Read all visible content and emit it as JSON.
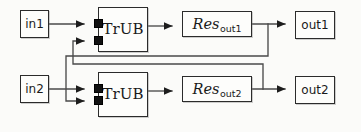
{
  "diagram": {
    "type": "block-diagram",
    "background_color": "#fbfbf9",
    "line_color": "#4a4a4a",
    "box_border_color": "#2b2b2b",
    "box_fill_color": "#fdfdfb",
    "port_color": "#111111",
    "nodes": [
      {
        "id": "in1",
        "label": "in1",
        "kind": "input",
        "x": 20,
        "y": 10,
        "w": 29,
        "h": 28
      },
      {
        "id": "in2",
        "label": "in2",
        "kind": "input",
        "x": 20,
        "y": 75,
        "w": 29,
        "h": 28
      },
      {
        "id": "trub1",
        "label": "TrUB",
        "kind": "process",
        "x": 98,
        "y": 7,
        "w": 50,
        "h": 45
      },
      {
        "id": "trub2",
        "label": "TrUB",
        "kind": "process",
        "x": 98,
        "y": 72,
        "w": 50,
        "h": 45
      },
      {
        "id": "res1",
        "label_main": "Res",
        "label_sub": "out1",
        "kind": "resource",
        "x": 182,
        "y": 11,
        "w": 70,
        "h": 26
      },
      {
        "id": "res2",
        "label_main": "Res",
        "label_sub": "out2",
        "kind": "resource",
        "x": 182,
        "y": 76,
        "w": 70,
        "h": 26
      },
      {
        "id": "out1",
        "label": "out1",
        "kind": "output",
        "x": 295,
        "y": 11,
        "w": 40,
        "h": 28
      },
      {
        "id": "out2",
        "label": "out2",
        "kind": "output",
        "x": 295,
        "y": 76,
        "w": 40,
        "h": 28
      }
    ],
    "ports": [
      {
        "id": "trub1-port-top",
        "node": "trub1",
        "x": 94,
        "y": 17
      },
      {
        "id": "trub1-port-bottom",
        "node": "trub1",
        "x": 94,
        "y": 34
      },
      {
        "id": "trub2-port-top",
        "node": "trub2",
        "x": 94,
        "y": 82
      },
      {
        "id": "trub2-port-bottom",
        "node": "trub2",
        "x": 94,
        "y": 99
      }
    ],
    "edges": [
      {
        "id": "e-in1-trub1",
        "from": "in1",
        "to": "trub1-port-top",
        "arrow": true
      },
      {
        "id": "e-in2-trub2",
        "from": "in2",
        "to": "trub2-port-top",
        "arrow": true
      },
      {
        "id": "e-trub1-res1",
        "from": "trub1",
        "to": "res1",
        "arrow": true
      },
      {
        "id": "e-trub2-res2",
        "from": "trub2",
        "to": "res2",
        "arrow": true
      },
      {
        "id": "e-res1-out1",
        "from": "res1",
        "to": "out1",
        "arrow": true
      },
      {
        "id": "e-res2-out2",
        "from": "res2",
        "to": "out2",
        "arrow": true
      },
      {
        "id": "e-res1-feedback-trub2",
        "from": "res1",
        "to": "trub2-port-bottom",
        "arrow": true,
        "routing": "down-left-down-right"
      },
      {
        "id": "e-res2-feedback-trub1",
        "from": "res2",
        "to": "trub1-port-bottom",
        "arrow": true,
        "routing": "up-left-up-right"
      }
    ]
  }
}
